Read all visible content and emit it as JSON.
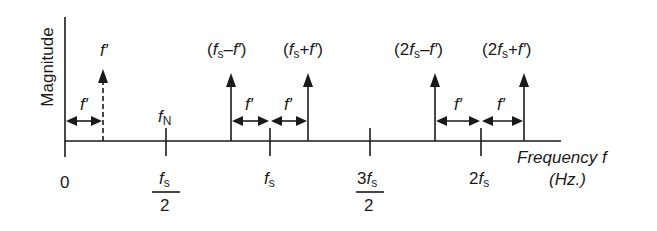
{
  "diagram": {
    "y_axis_label": "Magnitude",
    "x_axis_label_line1": "Frequency f",
    "x_axis_label_line2": "(Hz.)",
    "origin_label": "0",
    "nyquist_label_f": "f",
    "nyquist_label_sub": "N",
    "ticks": [
      {
        "id": "fs_half",
        "num_coef": "",
        "num_f": "f",
        "num_sub": "s",
        "den": "2"
      },
      {
        "id": "fs",
        "num_coef": "",
        "num_f": "f",
        "num_sub": "s"
      },
      {
        "id": "3fs_half",
        "num_coef": "3",
        "num_f": "f",
        "num_sub": "s",
        "den": "2"
      },
      {
        "id": "2fs",
        "num_coef": "2",
        "num_f": "f",
        "num_sub": "s"
      }
    ],
    "components": [
      {
        "id": "f_prime",
        "label": "f′",
        "style": "dashed"
      },
      {
        "id": "fs_minus_fprime",
        "open": "(",
        "coef": "",
        "f": "f",
        "sub": "s",
        "op": "–",
        "fp": "f′",
        "close": ")",
        "style": "solid"
      },
      {
        "id": "fs_plus_fprime",
        "open": "(",
        "coef": "",
        "f": "f",
        "sub": "s",
        "op": "+",
        "fp": "f′",
        "close": ")",
        "style": "solid"
      },
      {
        "id": "2fs_minus_fprime",
        "open": "(",
        "coef": "2",
        "f": "f",
        "sub": "s",
        "op": "–",
        "fp": "f′",
        "close": ")",
        "style": "solid"
      },
      {
        "id": "2fs_plus_fprime",
        "open": "(",
        "coef": "2",
        "f": "f",
        "sub": "s",
        "op": "+",
        "fp": "f′",
        "close": ")",
        "style": "solid"
      }
    ],
    "spacing_label": "f′"
  }
}
